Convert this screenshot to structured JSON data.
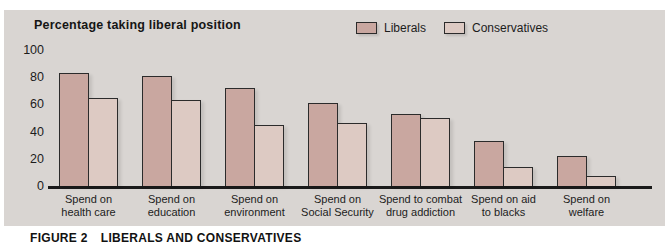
{
  "chart_data": {
    "type": "bar",
    "title": "Percentage taking liberal position",
    "categories": [
      "Spend on\nhealth care",
      "Spend on\neducation",
      "Spend on\nenvironment",
      "Spend on\nSocial Security",
      "Spend to combat\ndrug addiction",
      "Spend on aid\nto blacks",
      "Spend on\nwelfare"
    ],
    "series": [
      {
        "name": "Liberals",
        "color": "#c9a7a0",
        "values": [
          83,
          81,
          72,
          61,
          53,
          33,
          22
        ]
      },
      {
        "name": "Conservatives",
        "color": "#ddcac3",
        "values": [
          65,
          63,
          45,
          46,
          50,
          14,
          7
        ]
      }
    ],
    "xlabel": "",
    "ylabel": "Percentage taking liberal position",
    "ylim": [
      0,
      100
    ],
    "yticks": [
      0,
      20,
      40,
      60,
      80,
      100
    ],
    "legend_position": "top-right",
    "grid": false
  },
  "caption": {
    "label": "FIGURE 2",
    "title": "LIBERALS AND CONSERVATIVES"
  },
  "colors": {
    "panel_bg": "#d9d5d2",
    "bar_outline": "#2b2b2b",
    "axis": "#1a1a1a",
    "text": "#1c1c1c",
    "liberal": "#c9a7a0",
    "conservative": "#ddcac3"
  }
}
